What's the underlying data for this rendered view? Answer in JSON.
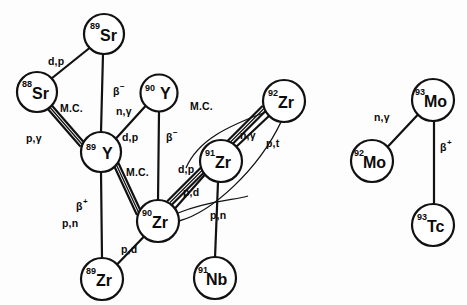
{
  "figure": {
    "kind": "nuclear-reaction-network-diagram",
    "background_color": "#fdfdfd",
    "ink_color": "#111111"
  },
  "nodes": [
    {
      "id": "sr89",
      "mass": "89",
      "symbol": "Sr",
      "cx": 104,
      "cy": 34,
      "r": 20
    },
    {
      "id": "sr88",
      "mass": "88",
      "symbol": "Sr",
      "cx": 37,
      "cy": 92,
      "r": 20
    },
    {
      "id": "y90",
      "mass": "90",
      "symbol": "Y",
      "cx": 159,
      "cy": 93,
      "r": 18.5
    },
    {
      "id": "y89",
      "mass": "89",
      "symbol": "Y",
      "cx": 101,
      "cy": 152,
      "r": 20
    },
    {
      "id": "zr92",
      "mass": "92",
      "symbol": "Zr",
      "cx": 284,
      "cy": 101,
      "r": 21
    },
    {
      "id": "zr91",
      "mass": "91",
      "symbol": "Zr",
      "cx": 221,
      "cy": 161,
      "r": 21
    },
    {
      "id": "zr90",
      "mass": "90",
      "symbol": "Zr",
      "cx": 158,
      "cy": 221,
      "r": 21
    },
    {
      "id": "zr89",
      "mass": "89",
      "symbol": "Zr",
      "cx": 102,
      "cy": 279,
      "r": 21
    },
    {
      "id": "nb91",
      "mass": "91",
      "symbol": "Nb",
      "cx": 215,
      "cy": 278,
      "r": 21
    },
    {
      "id": "mo93",
      "mass": "93",
      "symbol": "Mo",
      "cx": 433,
      "cy": 100,
      "r": 21
    },
    {
      "id": "mo92",
      "mass": "92",
      "symbol": "Mo",
      "cx": 372,
      "cy": 161,
      "r": 21
    },
    {
      "id": "tc93",
      "mass": "93",
      "symbol": "Tc",
      "cx": 433,
      "cy": 225,
      "r": 21
    }
  ],
  "edges": [
    {
      "id": "e-sr88-sr89",
      "from": "sr88",
      "to": "sr89",
      "style": "single",
      "label": "d,p"
    },
    {
      "id": "e-sr89-y89",
      "from": "sr89",
      "to": "y89",
      "style": "single",
      "label": "beta-minus"
    },
    {
      "id": "e-sr88-y89",
      "from": "sr88",
      "to": "y89",
      "style": "double",
      "label": "M.C.",
      "label2": "p,γ"
    },
    {
      "id": "e-y90-y89",
      "from": "y90",
      "to": "y89",
      "style": "single",
      "label": "n,γ"
    },
    {
      "id": "e-y90-zr90",
      "from": "y90",
      "to": "zr90",
      "style": "single",
      "label": "beta-minus"
    },
    {
      "id": "e-y89-zr90",
      "from": "y89",
      "to": "zr90",
      "style": "double",
      "label": "M.C."
    },
    {
      "id": "e-y89-zr89",
      "from": "y89",
      "to": "zr89",
      "style": "single",
      "label": "beta-plus",
      "label2": "p,n"
    },
    {
      "id": "e-zr89-zr90",
      "from": "zr89",
      "to": "zr90",
      "style": "single",
      "label": "p,d"
    },
    {
      "id": "e-zr90-zr91",
      "from": "zr90",
      "to": "zr91",
      "style": "single",
      "label": "d,p"
    },
    {
      "id": "e-zr90-zr92",
      "from": "zr90",
      "to": "zr92",
      "style": "double",
      "label": "M.C."
    },
    {
      "id": "e-zr91-zr92",
      "from": "zr91",
      "to": "zr92",
      "style": "single",
      "label": "n,γ"
    },
    {
      "id": "e-zr92-zr90-arc",
      "from": "zr92",
      "to": "zr90",
      "style": "arc",
      "label": "p,t"
    },
    {
      "id": "e-zr92-zr91-arc",
      "from": "zr92",
      "to": "zr91",
      "style": "arc",
      "label": "p,d"
    },
    {
      "id": "e-zr91-nb91",
      "from": "zr91",
      "to": "nb91",
      "style": "single",
      "label": ""
    },
    {
      "id": "e-zr90-nb91-arc",
      "from": "zr90",
      "to": "nb91",
      "style": "arc",
      "label": "p,n"
    },
    {
      "id": "e-mo92-mo93",
      "from": "mo92",
      "to": "mo93",
      "style": "single",
      "label": "n,γ"
    },
    {
      "id": "e-mo93-tc93",
      "from": "mo93",
      "to": "tc93",
      "style": "single",
      "label": "beta-plus"
    }
  ],
  "labels": [
    {
      "id": "lbl-dp-1",
      "text": "d,p",
      "sup": "",
      "x": 62,
      "y": 61,
      "for": "e-sr88-sr89"
    },
    {
      "id": "lbl-beta-1",
      "text": "β",
      "sup": "−",
      "x": 113,
      "y": 92,
      "for": "e-sr89-y89"
    },
    {
      "id": "lbl-mc-1",
      "text": "M.C.",
      "sup": "",
      "x": 62,
      "y": 109,
      "for": "e-sr88-y89"
    },
    {
      "id": "lbl-pgamma",
      "text": "p,γ",
      "sup": "",
      "x": 36,
      "y": 139,
      "for": "e-sr88-y89"
    },
    {
      "id": "lbl-ngamma-1",
      "text": "n,γ",
      "sup": "",
      "x": 118,
      "y": 112,
      "for": "e-y90-y89"
    },
    {
      "id": "lbl-dp-2",
      "text": "d,p",
      "sup": "",
      "x": 124,
      "y": 137,
      "for": "e-y90-y89"
    },
    {
      "id": "lbl-beta-2",
      "text": "β",
      "sup": "−",
      "x": 166,
      "y": 137,
      "for": "e-y90-zr90"
    },
    {
      "id": "lbl-mc-2",
      "text": "M.C.",
      "sup": "",
      "x": 130,
      "y": 172,
      "for": "e-y89-zr90"
    },
    {
      "id": "lbl-beta-3",
      "text": "β",
      "sup": "+",
      "x": 78,
      "y": 206,
      "for": "e-y89-zr89"
    },
    {
      "id": "lbl-pn-1",
      "text": "p,n",
      "sup": "",
      "x": 71,
      "y": 222,
      "for": "e-y89-zr89"
    },
    {
      "id": "lbl-pd-1",
      "text": "p,d",
      "sup": "",
      "x": 126,
      "y": 249,
      "for": "e-zr89-zr90"
    },
    {
      "id": "lbl-mc-3",
      "text": "M.C.",
      "sup": "",
      "x": 198,
      "y": 107,
      "for": "e-zr90-zr92"
    },
    {
      "id": "lbl-ngamma-2",
      "text": "n,γ",
      "sup": "",
      "x": 244,
      "y": 136,
      "for": "e-zr91-zr92"
    },
    {
      "id": "lbl-pt",
      "text": "p,t",
      "sup": "",
      "x": 271,
      "y": 144,
      "for": "e-zr92-zr90-arc"
    },
    {
      "id": "lbl-dp-3",
      "text": "d,p",
      "sup": "",
      "x": 183,
      "y": 170,
      "for": "e-zr90-zr91"
    },
    {
      "id": "lbl-pd-2",
      "text": "p,d",
      "sup": "",
      "x": 189,
      "y": 192,
      "for": "e-zr92-zr91-arc"
    },
    {
      "id": "lbl-pn-2",
      "text": "p,n",
      "sup": "",
      "x": 216,
      "y": 215,
      "for": "e-zr90-nb91-arc"
    },
    {
      "id": "lbl-ngamma-3",
      "text": "n,γ",
      "sup": "",
      "x": 380,
      "y": 118,
      "for": "e-mo92-mo93"
    },
    {
      "id": "lbl-beta-4",
      "text": "β",
      "sup": "+",
      "x": 440,
      "y": 147,
      "for": "e-mo93-tc93"
    }
  ]
}
